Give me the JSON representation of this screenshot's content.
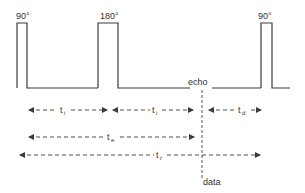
{
  "diagram": {
    "type": "pulse-sequence",
    "colors": {
      "line": "#3a3a3a",
      "background": "#ffffff"
    },
    "pulses": [
      {
        "label": "90°",
        "x_start": 17,
        "x_end": 27
      },
      {
        "label": "180°",
        "x_start": 98,
        "x_end": 118
      },
      {
        "label": "90°",
        "x_start": 261,
        "x_end": 272
      }
    ],
    "echo_label": "echo",
    "data_label": "data",
    "intervals": [
      {
        "name": "ti-1",
        "label": "t",
        "sub": "i",
        "from": 30,
        "to": 107,
        "row": 1
      },
      {
        "name": "ti-2",
        "label": "t",
        "sub": "i",
        "from": 115,
        "to": 193,
        "row": 1
      },
      {
        "name": "td",
        "label": "t",
        "sub": "d",
        "from": 210,
        "to": 260,
        "row": 1
      },
      {
        "name": "te",
        "label": "t",
        "sub": "e",
        "from": 30,
        "to": 193,
        "row": 2
      },
      {
        "name": "tr",
        "label": "t",
        "sub": "r",
        "from": 20,
        "to": 260,
        "row": 3
      }
    ]
  }
}
